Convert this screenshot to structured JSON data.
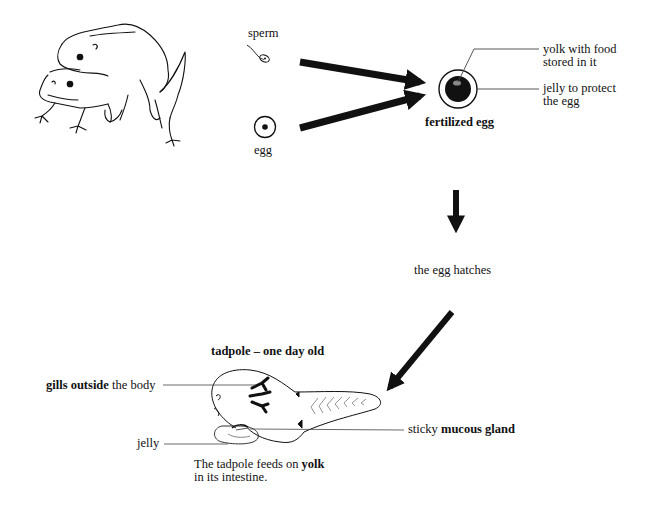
{
  "diagram": {
    "stages": {
      "parents": {
        "icon": "mating-frogs-icon"
      },
      "sperm": {
        "label": "sperm"
      },
      "egg": {
        "label": "egg"
      },
      "fertilized_egg": {
        "label": "fertilized egg",
        "annotations": {
          "yolk_line1": "yolk with food",
          "yolk_line2": "stored in it",
          "jelly_line1": "jelly to protect",
          "jelly_line2": "the egg"
        }
      },
      "hatching": {
        "label": "the egg hatches"
      },
      "tadpole": {
        "title": "tadpole – one day old",
        "annotations": {
          "gills_bold": "gills outside",
          "gills_rest": " the body",
          "jelly": "jelly",
          "gland_plain": "sticky ",
          "gland_bold": "mucous gland",
          "feeds_plain": "The tadpole feeds on ",
          "feeds_bold": "yolk",
          "feeds_line2": "in its intestine."
        }
      }
    },
    "colors": {
      "ink": "#111111",
      "background": "#ffffff",
      "leader_line": "#444444"
    }
  }
}
